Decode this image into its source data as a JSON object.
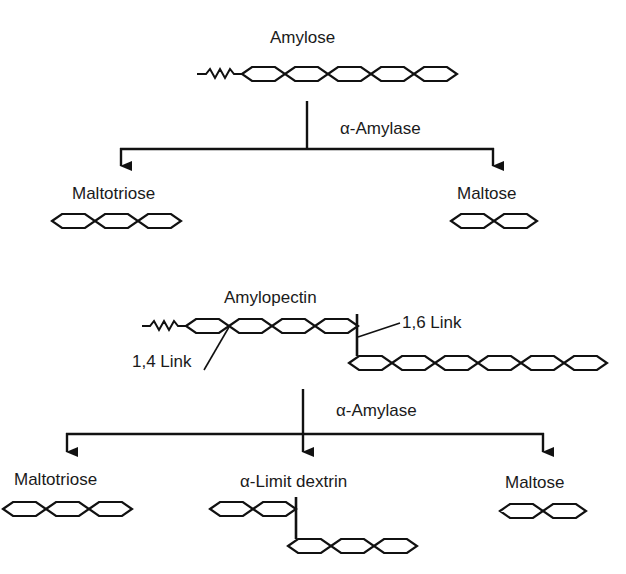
{
  "diagram": {
    "top": {
      "substrate_label": "Amylose",
      "enzyme_label": "α-Amylase",
      "products": [
        {
          "label": "Maltotriose",
          "units": 3
        },
        {
          "label": "Maltose",
          "units": 2
        }
      ],
      "substrate_units": 5
    },
    "bottom": {
      "substrate_label": "Amylopectin",
      "link_14_label": "1,4 Link",
      "link_16_label": "1,6 Link",
      "main_chain_units": 4,
      "branch_chain_units": 6,
      "enzyme_label": "α-Amylase",
      "products": [
        {
          "label": "Maltotriose",
          "units": 3
        },
        {
          "label": "α-Limit dextrin",
          "main_units": 2,
          "branch_units": 3
        },
        {
          "label": "Maltose",
          "units": 2
        }
      ]
    },
    "colors": {
      "stroke": "#111111",
      "background": "#ffffff"
    }
  }
}
